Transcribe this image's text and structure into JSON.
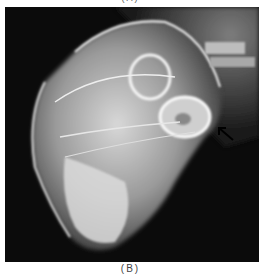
{
  "figure": {
    "top_caption": "(A)",
    "bottom_caption": "(B)",
    "image_description": "Lateral radiograph of an animal skull",
    "annotation": {
      "type": "arrow",
      "direction": "up-left"
    }
  },
  "colors": {
    "background": "#0b0b0b",
    "bone": "#e8e8e8",
    "arrow": "#000000"
  }
}
